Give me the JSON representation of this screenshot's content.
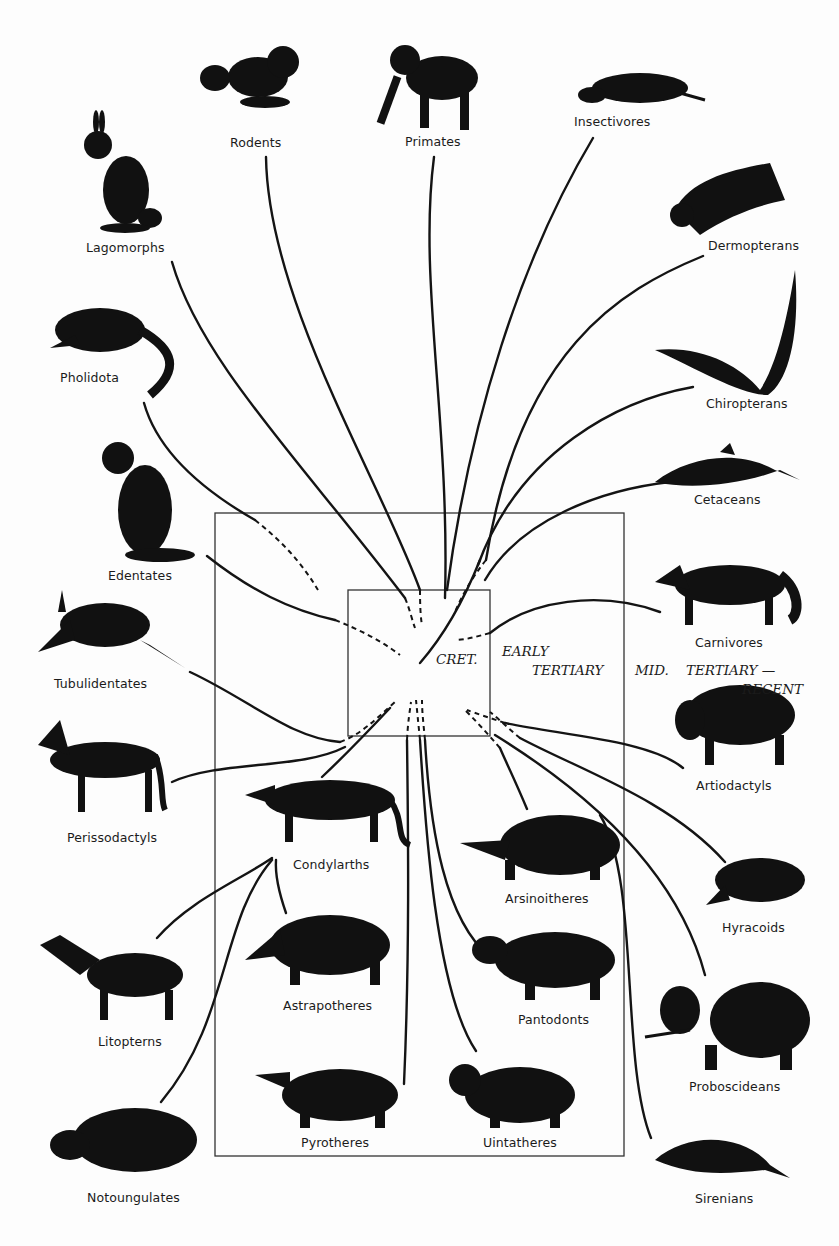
{
  "diagram": {
    "eras": {
      "cretaceous": "CRET.",
      "early_tertiary_1": "EARLY",
      "early_tertiary_2": "TERTIARY",
      "mid_tertiary_1": "MID.",
      "mid_tertiary_2": "TERTIARY —",
      "mid_tertiary_3": "RECENT"
    },
    "groups": [
      {
        "id": "rodents",
        "label": "Rodents",
        "x": 230,
        "y": 106
      },
      {
        "id": "primates",
        "label": "Primates",
        "x": 405,
        "y": 128
      },
      {
        "id": "insectivores",
        "label": "Insectivores",
        "x": 574,
        "y": 117
      },
      {
        "id": "lagomorphs",
        "label": "Lagomorphs",
        "x": 86,
        "y": 240
      },
      {
        "id": "dermopterans",
        "label": "Dermopterans",
        "x": 708,
        "y": 239
      },
      {
        "id": "pholidota",
        "label": "Pholidota",
        "x": 60,
        "y": 378
      },
      {
        "id": "chiropterans",
        "label": "Chiropterans",
        "x": 706,
        "y": 404
      },
      {
        "id": "cetaceans",
        "label": "Cetaceans",
        "x": 694,
        "y": 494
      },
      {
        "id": "edentates",
        "label": "Edentates",
        "x": 108,
        "y": 570
      },
      {
        "id": "carnivores",
        "label": "Carnivores",
        "x": 695,
        "y": 635
      },
      {
        "id": "tubulidentates",
        "label": "Tubulidentates",
        "x": 54,
        "y": 675
      },
      {
        "id": "artiodactyls",
        "label": "Artiodactyls",
        "x": 696,
        "y": 778
      },
      {
        "id": "perissodactyls",
        "label": "Perissodactyls",
        "x": 67,
        "y": 829
      },
      {
        "id": "condylarths",
        "label": "Condylarths",
        "x": 293,
        "y": 857
      },
      {
        "id": "arsinoitheres",
        "label": "Arsinoitheres",
        "x": 505,
        "y": 892
      },
      {
        "id": "hyracoids",
        "label": "Hyracoids",
        "x": 722,
        "y": 922
      },
      {
        "id": "astrapotheres",
        "label": "Astrapotheres",
        "x": 283,
        "y": 999
      },
      {
        "id": "pantodonts",
        "label": "Pantodonts",
        "x": 518,
        "y": 1013
      },
      {
        "id": "litopterns",
        "label": "Litopterns",
        "x": 98,
        "y": 1036
      },
      {
        "id": "proboscideans",
        "label": "Proboscideans",
        "x": 689,
        "y": 1080
      },
      {
        "id": "pyrotheres",
        "label": "Pyrotheres",
        "x": 301,
        "y": 1136
      },
      {
        "id": "uintatheres",
        "label": "Uintatheres",
        "x": 483,
        "y": 1136
      },
      {
        "id": "notoungulates",
        "label": "Notoungulates",
        "x": 87,
        "y": 1190
      },
      {
        "id": "sirenians",
        "label": "Sirenians",
        "x": 695,
        "y": 1191
      }
    ]
  }
}
